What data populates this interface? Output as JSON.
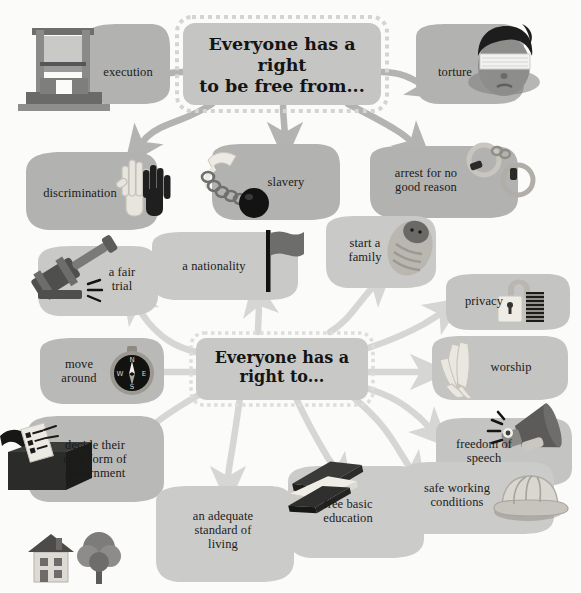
{
  "graphic": {
    "title_top": "Everyone has a right\nto be free from...",
    "title_bottom": "Everyone has a\nright to...",
    "palette": {
      "background": "#fbfbfa",
      "node_dark": "#b0b0ae",
      "node_mid": "#c2c2c0",
      "node_light": "#cfcfcd",
      "node_pale": "#dcdcda",
      "hub_fill": "#c6c6c4",
      "hub_border": "#d8d8d6",
      "arrow_dark": "#b3b3b1",
      "arrow_light": "#dadada",
      "text": "#1b1b1b"
    }
  },
  "top_hub": {
    "label": "Everyone has a right to be free from...",
    "line1": "Everyone has a right",
    "line2": "to be free from..."
  },
  "bottom_hub": {
    "label": "Everyone has a right to...",
    "line1": "Everyone has a",
    "line2": "right to..."
  },
  "freedom_from_nodes": [
    {
      "id": "execution",
      "label": "execution",
      "lines": [
        "execution"
      ],
      "icon": "guillotine-icon"
    },
    {
      "id": "torture",
      "label": "torture",
      "lines": [
        "torture"
      ],
      "icon": "blindfolded-head-icon"
    },
    {
      "id": "discrimination",
      "label": "discrimination",
      "lines": [
        "discrimination"
      ],
      "icon": "two-hands-icon"
    },
    {
      "id": "slavery",
      "label": "slavery",
      "lines": [
        "slavery"
      ],
      "icon": "ball-and-chain-icon"
    },
    {
      "id": "arrest",
      "label": "arrest for no good reason",
      "lines": [
        "arrest for no",
        "good reason"
      ],
      "icon": "handcuffs-icon"
    }
  ],
  "right_to_nodes": [
    {
      "id": "fair-trial",
      "label": "a fair trial",
      "lines": [
        "a fair",
        "trial"
      ],
      "icon": "gavel-icon"
    },
    {
      "id": "nationality",
      "label": "a nationality",
      "lines": [
        "a nationality"
      ],
      "icon": "flag-icon"
    },
    {
      "id": "family",
      "label": "start a family",
      "lines": [
        "start a",
        "family"
      ],
      "icon": "baby-icon"
    },
    {
      "id": "privacy",
      "label": "privacy",
      "lines": [
        "privacy"
      ],
      "icon": "padlock-icon"
    },
    {
      "id": "worship",
      "label": "worship",
      "lines": [
        "worship"
      ],
      "icon": "praying-hands-icon"
    },
    {
      "id": "move-around",
      "label": "move around",
      "lines": [
        "move",
        "around"
      ],
      "icon": "compass-icon"
    },
    {
      "id": "government",
      "label": "decide their own form of government",
      "lines": [
        "decide their",
        "own form of",
        "government"
      ],
      "icon": "ballot-box-icon"
    },
    {
      "id": "speech",
      "label": "freedom of speech",
      "lines": [
        "freedom of",
        "speech"
      ],
      "icon": "megaphone-icon"
    },
    {
      "id": "work",
      "label": "safe working conditions",
      "lines": [
        "safe working",
        "conditions"
      ],
      "icon": "hard-hat-icon"
    },
    {
      "id": "education",
      "label": "free basic education",
      "lines": [
        "free basic",
        "education"
      ],
      "icon": "books-icon"
    },
    {
      "id": "living",
      "label": "an adequate standard of living",
      "lines": [
        "an adequate",
        "standard of",
        "living"
      ],
      "icon": "house-tree-icon"
    }
  ],
  "compass": {
    "n": "N",
    "e": "E",
    "s": "S",
    "w": "W"
  }
}
